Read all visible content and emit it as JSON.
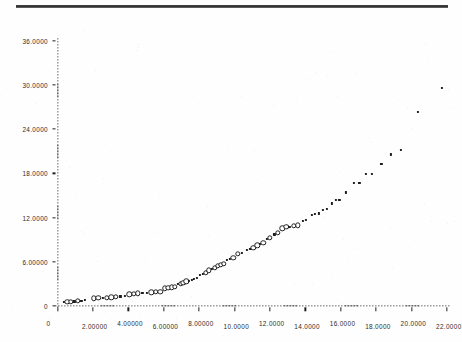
{
  "page": {
    "background_color": "#ffffff",
    "ink_color": "#1c1c1c",
    "top_rule_color": "#2e2e2e"
  },
  "chart_data": {
    "type": "scatter",
    "title": "",
    "subtitle": "",
    "xlabel": "",
    "ylabel": "",
    "xlim": [
      0,
      22
    ],
    "ylim": [
      0,
      36
    ],
    "grid": false,
    "legend": null,
    "axis_style": "dotted",
    "x_ticks": [
      0,
      2,
      4,
      6,
      8,
      10,
      12,
      14,
      16,
      18,
      20,
      22
    ],
    "x_tick_labels": [
      "0",
      "2.00000",
      "4.00000",
      "6.00000",
      "8.00000",
      "10.0000",
      "12.0000",
      "14.0000",
      "16.0000",
      "18.0000",
      "20.0000",
      "22.0000"
    ],
    "y_ticks": [
      0,
      6,
      12,
      18,
      24,
      30,
      36
    ],
    "y_tick_labels": [
      "0",
      "6.00000",
      "12.0000",
      "18.0000",
      "24.0000",
      "30.0000",
      "36.0000"
    ],
    "marker": "small circle / dot",
    "series": [
      {
        "name": "data",
        "marker": "o",
        "points": [
          [
            0.35,
            0.55
          ],
          [
            0.55,
            0.55
          ],
          [
            0.75,
            0.6
          ],
          [
            0.95,
            0.62
          ],
          [
            1.15,
            0.7
          ],
          [
            1.35,
            0.72
          ],
          [
            1.55,
            0.8
          ],
          [
            2.05,
            1.05
          ],
          [
            2.3,
            1.08
          ],
          [
            2.55,
            1.12
          ],
          [
            2.8,
            1.15
          ],
          [
            3.05,
            1.2
          ],
          [
            3.3,
            1.25
          ],
          [
            3.55,
            1.3
          ],
          [
            3.8,
            1.32
          ],
          [
            4.05,
            1.6
          ],
          [
            4.3,
            1.65
          ],
          [
            4.55,
            1.7
          ],
          [
            4.8,
            1.75
          ],
          [
            5.05,
            1.8
          ],
          [
            5.3,
            1.85
          ],
          [
            5.55,
            1.9
          ],
          [
            5.8,
            1.95
          ],
          [
            6.05,
            2.4
          ],
          [
            6.25,
            2.45
          ],
          [
            6.45,
            2.52
          ],
          [
            6.62,
            2.6
          ],
          [
            6.8,
            2.95
          ],
          [
            6.95,
            3.05
          ],
          [
            7.1,
            3.15
          ],
          [
            7.28,
            3.35
          ],
          [
            7.42,
            3.45
          ],
          [
            7.58,
            3.55
          ],
          [
            7.72,
            3.7
          ],
          [
            7.86,
            3.85
          ],
          [
            8.05,
            4.2
          ],
          [
            8.22,
            4.35
          ],
          [
            8.38,
            4.5
          ],
          [
            8.55,
            4.85
          ],
          [
            8.72,
            5.0
          ],
          [
            8.88,
            5.15
          ],
          [
            9.05,
            5.45
          ],
          [
            9.22,
            5.6
          ],
          [
            9.4,
            5.75
          ],
          [
            9.58,
            6.25
          ],
          [
            9.75,
            6.4
          ],
          [
            9.92,
            6.55
          ],
          [
            10.2,
            7.05
          ],
          [
            10.4,
            7.2
          ],
          [
            10.7,
            7.6
          ],
          [
            10.9,
            7.75
          ],
          [
            11.05,
            7.9
          ],
          [
            11.28,
            8.25
          ],
          [
            11.45,
            8.4
          ],
          [
            11.62,
            8.6
          ],
          [
            11.82,
            9.05
          ],
          [
            11.98,
            9.25
          ],
          [
            12.25,
            9.7
          ],
          [
            12.45,
            9.9
          ],
          [
            12.7,
            10.55
          ],
          [
            12.92,
            10.7
          ],
          [
            13.1,
            10.75
          ],
          [
            13.35,
            10.9
          ],
          [
            13.58,
            10.95
          ],
          [
            13.85,
            11.55
          ],
          [
            14.05,
            11.7
          ],
          [
            14.35,
            12.3
          ],
          [
            14.55,
            12.45
          ],
          [
            14.75,
            12.55
          ],
          [
            15.0,
            13.05
          ],
          [
            15.2,
            13.2
          ],
          [
            15.5,
            13.9
          ],
          [
            15.72,
            14.35
          ],
          [
            15.92,
            14.4
          ],
          [
            16.3,
            15.4
          ],
          [
            16.75,
            16.65
          ],
          [
            17.05,
            16.7
          ],
          [
            17.4,
            17.9
          ],
          [
            17.75,
            17.9
          ],
          [
            18.3,
            19.25
          ],
          [
            18.85,
            20.55
          ],
          [
            19.4,
            21.15
          ],
          [
            20.35,
            26.35
          ],
          [
            21.7,
            29.6
          ]
        ]
      }
    ]
  }
}
